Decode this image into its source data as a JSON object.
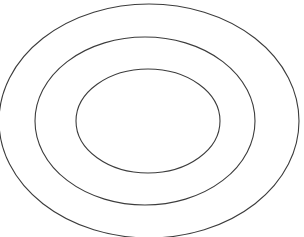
{
  "figure": {
    "background_color": "#ffffff",
    "width": 304,
    "height": 237,
    "shape_count": "3"
  },
  "chart_data": {
    "type": "scatter",
    "title": "",
    "xlabel": "",
    "ylabel": "",
    "grid": false,
    "legend": "none",
    "xlim": [
      0,
      304
    ],
    "ylim": [
      0,
      237
    ],
    "shapes": [
      {
        "name": "outer-ellipse",
        "shape": "ellipse",
        "cx": 149,
        "cy": 121,
        "rx": 150,
        "ry": 117,
        "stroke": "#3c3c3c",
        "stroke_width": 1.1,
        "fill": "none",
        "clipped": "left, right and bottom edges"
      },
      {
        "name": "middle-ellipse",
        "shape": "ellipse",
        "cx": 145,
        "cy": 121,
        "rx": 110,
        "ry": 84,
        "stroke": "#3c3c3c",
        "stroke_width": 1.1,
        "fill": "none",
        "clipped": "none"
      },
      {
        "name": "inner-ellipse",
        "shape": "ellipse",
        "cx": 148,
        "cy": 121,
        "rx": 72,
        "ry": 52,
        "stroke": "#3c3c3c",
        "stroke_width": 1.1,
        "fill": "none",
        "clipped": "none"
      }
    ]
  }
}
